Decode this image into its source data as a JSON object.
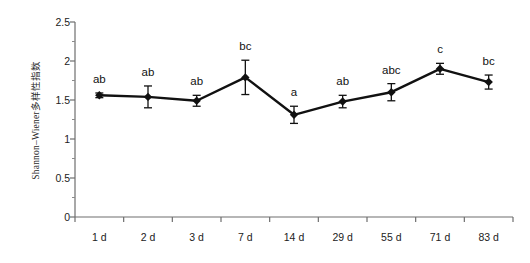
{
  "chart_data": {
    "type": "line",
    "title": "",
    "xlabel": "",
    "ylabel": "Shannon–Wiener多样性指数",
    "categories": [
      "1 d",
      "2 d",
      "3 d",
      "7 d",
      "14 d",
      "29 d",
      "55 d",
      "71 d",
      "83 d"
    ],
    "values": [
      1.56,
      1.54,
      1.49,
      1.79,
      1.31,
      1.48,
      1.6,
      1.9,
      1.73
    ],
    "errors": [
      0.03,
      0.14,
      0.07,
      0.22,
      0.11,
      0.08,
      0.11,
      0.07,
      0.09
    ],
    "annotations": [
      "ab",
      "ab",
      "ab",
      "bc",
      "a",
      "ab",
      "abc",
      "c",
      "bc"
    ],
    "ylim": [
      0,
      2.5
    ],
    "ytick_values": [
      0,
      0.5,
      1,
      1.5,
      2,
      2.5
    ],
    "ytick_labels": [
      "0",
      "0.5",
      "1",
      "1.5",
      "2",
      "2.5"
    ],
    "yminor_step": 0.25,
    "grid": false,
    "legend": "none",
    "marker": "diamond",
    "series_color": "#111111"
  }
}
